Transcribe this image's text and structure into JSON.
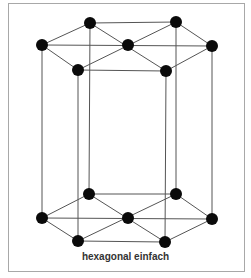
{
  "diagram": {
    "caption": "hexagonal einfach",
    "colors": {
      "line": "#555555",
      "node": "#0a0a0a",
      "border": "#a8a8a8",
      "text": "#333333"
    },
    "nodes": {
      "top": [
        {
          "id": "t_back_left",
          "x": 90,
          "y": 23
        },
        {
          "id": "t_back_right",
          "x": 176,
          "y": 22
        },
        {
          "id": "t_left",
          "x": 42,
          "y": 45
        },
        {
          "id": "t_center",
          "x": 128,
          "y": 45
        },
        {
          "id": "t_right",
          "x": 212,
          "y": 46
        },
        {
          "id": "t_front_left",
          "x": 78,
          "y": 70
        },
        {
          "id": "t_front_right",
          "x": 166,
          "y": 71
        }
      ],
      "bottom": [
        {
          "id": "b_back_left",
          "x": 89,
          "y": 194
        },
        {
          "id": "b_back_right",
          "x": 176,
          "y": 194
        },
        {
          "id": "b_left",
          "x": 42,
          "y": 218
        },
        {
          "id": "b_center",
          "x": 128,
          "y": 218
        },
        {
          "id": "b_right",
          "x": 212,
          "y": 219
        },
        {
          "id": "b_front_left",
          "x": 78,
          "y": 241
        },
        {
          "id": "b_front_right",
          "x": 165,
          "y": 242
        }
      ]
    }
  }
}
